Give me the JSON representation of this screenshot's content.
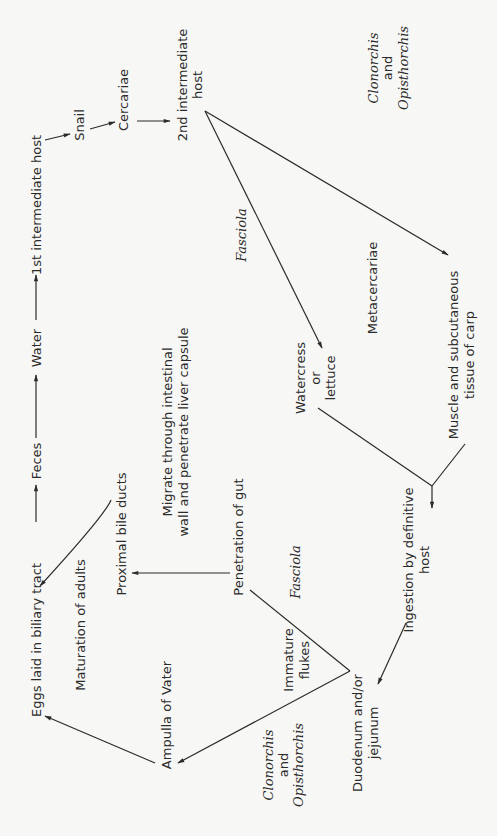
{
  "diagram": {
    "type": "life-cycle flowchart (rotated 90°)",
    "nodes": {
      "eggs": "Eggs laid in biliary tract",
      "feces": "Feces",
      "water": "Water",
      "first_host": "1st intermediate host",
      "snail": "Snail",
      "cercariae": "Cercariae",
      "second_host_1": "2nd intermediate",
      "second_host_2": "host",
      "clon_top_1": "Clonorchis",
      "clon_top_2": "and",
      "clon_top_3": "Opisthorchis",
      "fasciola_top": "Fasciola",
      "metacercariae": "Metacercariae",
      "watercress_1": "Watercress",
      "watercress_2": "or",
      "watercress_3": "lettuce",
      "muscle_1": "Muscle and subcutaneous",
      "muscle_2": "tissue of carp",
      "ingestion_1": "Ingestion by definitive",
      "ingestion_2": "host",
      "maturation": "Maturation of adults",
      "proximal": "Proximal bile ducts",
      "migrate_1": "Migrate through intestinal",
      "migrate_2": "wall and penetrate liver capsule",
      "penetration": "Penetration of gut",
      "fasciola_mid": "Fasciola",
      "immature_1": "Immature",
      "immature_2": "flukes",
      "ampulla": "Ampulla of Vater",
      "clon_bot_1": "Clonorchis",
      "clon_bot_2": "and",
      "clon_bot_3": "Opisthorchis",
      "duodenum_1": "Duodenum and/or",
      "duodenum_2": "jejunum"
    },
    "edges": [
      [
        "Eggs laid in biliary tract",
        "Feces"
      ],
      [
        "Feces",
        "Water"
      ],
      [
        "Water",
        "1st intermediate host"
      ],
      [
        "1st intermediate host",
        "Snail"
      ],
      [
        "Snail",
        "Cercariae"
      ],
      [
        "Cercariae",
        "2nd intermediate host"
      ],
      [
        "2nd intermediate host",
        "Watercress or lettuce",
        "Fasciola"
      ],
      [
        "2nd intermediate host",
        "Muscle and subcutaneous tissue of carp",
        "Clonorchis and Opisthorchis"
      ],
      [
        "Watercress or lettuce / Muscle and subcutaneous tissue of carp",
        "Ingestion by definitive host"
      ],
      [
        "Ingestion by definitive host",
        "Duodenum and/or jejunum"
      ],
      [
        "Duodenum and/or jejunum",
        "Penetration of gut",
        "Fasciola"
      ],
      [
        "Penetration of gut",
        "Proximal bile ducts",
        "Migrate through intestinal wall and penetrate liver capsule"
      ],
      [
        "Proximal bile ducts",
        "Eggs laid in biliary tract",
        "Maturation of adults"
      ],
      [
        "Duodenum and/or jejunum",
        "Ampulla of Vater",
        "Clonorchis and Opisthorchis"
      ],
      [
        "Ampulla of Vater",
        "Eggs laid in biliary tract"
      ]
    ],
    "colors": {
      "ink": "#2b2b2b",
      "paper": "#f7f7f5"
    }
  }
}
